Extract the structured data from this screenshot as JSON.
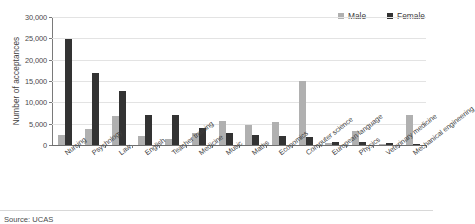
{
  "chart_data": {
    "type": "bar",
    "title": "",
    "xlabel": "",
    "ylabel": "Number of acceptances",
    "ylim": [
      0,
      30000
    ],
    "yticks": [
      0,
      5000,
      10000,
      15000,
      20000,
      25000,
      30000
    ],
    "ytick_labels": [
      "0",
      "5,000",
      "10,000",
      "15,000",
      "20,000",
      "25,000",
      "30,000"
    ],
    "grid": true,
    "legend_position": "top-right",
    "categories": [
      "Nursing",
      "Psychology",
      "Law",
      "English",
      "Teacher training",
      "Medicine",
      "Music",
      "Maths",
      "Economics",
      "Computer science",
      "European language",
      "Physics",
      "Veterinary medicine",
      "Mechanical engineering"
    ],
    "series": [
      {
        "name": "Male",
        "color": "#b0b0b0",
        "values": [
          2400,
          3800,
          6900,
          2000,
          1500,
          2900,
          5600,
          4800,
          5300,
          15000,
          400,
          3400,
          200,
          7000
        ]
      },
      {
        "name": "Female",
        "color": "#333333",
        "values": [
          24900,
          16800,
          12600,
          7100,
          7100,
          4000,
          2900,
          2400,
          2000,
          1900,
          600,
          600,
          500,
          300
        ]
      }
    ]
  },
  "source": {
    "text": "Source: UCAS"
  },
  "colors": {
    "male": "#b0b0b0",
    "female": "#333333",
    "grid": "#e3e3e3",
    "axis": "#7a7a7a",
    "text": "#3a3a3a",
    "background": "#ffffff"
  }
}
